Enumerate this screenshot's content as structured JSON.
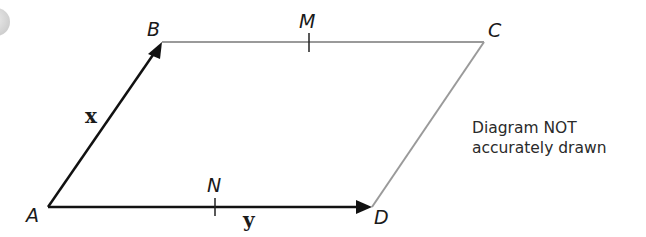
{
  "diagram": {
    "type": "parallelogram-vectors",
    "vertices": {
      "A": "A",
      "B": "B",
      "C": "C",
      "D": "D"
    },
    "midpoints": {
      "M": "M",
      "N": "N"
    },
    "vectors": {
      "AB": "x",
      "AD": "y"
    },
    "note_line1": "Diagram NOT",
    "note_line2": "accurately drawn",
    "colors": {
      "vector_line": "#111111",
      "plain_line": "#9a9a9a",
      "corner_circle": "#d8d8d8"
    }
  }
}
